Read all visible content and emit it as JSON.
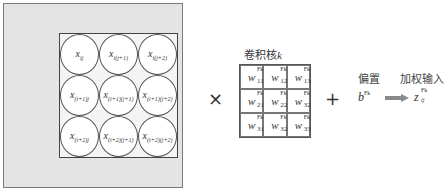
{
  "input": {
    "cells": [
      [
        "x_ij",
        "x_i(j+1)",
        "x_i(j+2)"
      ],
      [
        "x_(i+1)j",
        "x_(i+1)(j+1)",
        "x_(i+1)(j+2)"
      ],
      [
        "x_(i+2)j",
        "x_(i+2)(j+1)",
        "x_(i+2)(j+2)"
      ]
    ],
    "cell_display": {
      "r0c0": {
        "base": "x",
        "sub": "ij"
      },
      "r0c1": {
        "base": "x",
        "sub": "i(j+1)"
      },
      "r0c2": {
        "base": "x",
        "sub": "i(j+2)"
      },
      "r1c0": {
        "base": "x",
        "sub": "(i+1)j"
      },
      "r1c1": {
        "base": "x",
        "sub": "(i+1)(j+1)"
      },
      "r1c2": {
        "base": "x",
        "sub": "(i+1)(j+2)"
      },
      "r2c0": {
        "base": "x",
        "sub": "(i+2)j"
      },
      "r2c1": {
        "base": "x",
        "sub": "(i+2)(j+1)"
      },
      "r2c2": {
        "base": "x",
        "sub": "(i+2)(j+2)"
      }
    }
  },
  "operators": {
    "multiply": "×",
    "plus": "+"
  },
  "kernel": {
    "title_prefix": "卷积核",
    "title_var": "k",
    "superscript": "Fk",
    "base": "w",
    "subs": {
      "r0c0": "11",
      "r0c1": "12",
      "r0c2": "13",
      "r1c0": "21",
      "r1c1": "22",
      "r1c2": "32",
      "r2c0": "31",
      "r2c1": "32",
      "r2c2": "33"
    }
  },
  "bias": {
    "label": "偏置",
    "base": "b",
    "superscript": "Fk"
  },
  "output": {
    "label": "加权输入",
    "base": "z",
    "sub": "ij",
    "superscript": "Fk",
    "arrow_color": "#8a8a8a"
  }
}
